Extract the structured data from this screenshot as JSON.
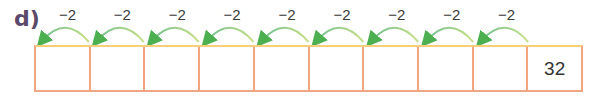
{
  "exercise": {
    "label": "d)",
    "step_value": "−2",
    "cells": [
      "",
      "",
      "",
      "",
      "",
      "",
      "",
      "",
      "",
      "32"
    ],
    "arrow_count": 9,
    "colors": {
      "cell_border": "#f2a582",
      "arc": "#8ccaa8",
      "arrowhead": "#4caf50",
      "label": "#5b4a6b"
    }
  }
}
